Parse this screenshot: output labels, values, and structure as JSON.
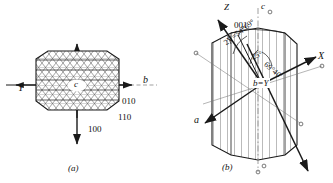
{
  "figure": {
    "panels": [
      {
        "id": "a",
        "caption": "(a)",
        "center_label": "c",
        "axes": [
          {
            "name": "b",
            "label": "b",
            "position": "right"
          },
          {
            "name": "Y",
            "label": "Y",
            "position": "left"
          }
        ],
        "face_labels": [
          {
            "label": "010"
          },
          {
            "label": "110"
          },
          {
            "label": "100"
          }
        ]
      },
      {
        "id": "b",
        "caption": "(b)",
        "center_label": "b=Y",
        "axes": [
          {
            "name": "Z",
            "label": "Z"
          },
          {
            "name": "X",
            "label": "X"
          },
          {
            "name": "a",
            "label": "a"
          },
          {
            "name": "c",
            "label": "c"
          }
        ],
        "face_labels": [
          {
            "label": "001"
          }
        ],
        "angle_labels": [
          {
            "label": "2V=54°69°"
          },
          {
            "label": "25°"
          },
          {
            "label": "69°40'"
          }
        ],
        "optic_axis_markers": [
          "o",
          "o",
          "o",
          "o",
          "o",
          "o"
        ]
      }
    ],
    "colors": {
      "ink": "#1a1a1a",
      "thin": "#555555",
      "background": "#ffffff"
    }
  }
}
